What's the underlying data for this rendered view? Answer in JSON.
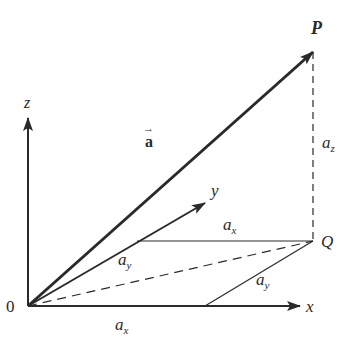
{
  "diagram": {
    "colors": {
      "ink": "#2a2a2a",
      "background": "#ffffff"
    },
    "labels": {
      "origin": "0",
      "x_axis": "x",
      "y_axis": "y",
      "z_axis": "z",
      "point_p": "P",
      "point_q": "Q",
      "vector_a": "a",
      "vector_arrow": "→",
      "component_base": "a",
      "az_sub": "z",
      "ax_top_sub": "x",
      "ay_left_sub": "y",
      "ay_right_sub": "y",
      "ax_bottom_sub": "x"
    },
    "elements": [
      "x-axis",
      "y-axis",
      "z-axis",
      "vector-a (O to P)",
      "dashed projection P to Q",
      "dashed line O to Q",
      "a_x segment parallel to x-axis ending at Q",
      "a_y segment parallel to y-axis from x-axis to Q"
    ]
  }
}
